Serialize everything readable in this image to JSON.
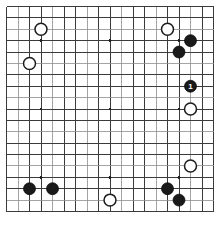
{
  "figure": {
    "type": "go-board-diagram",
    "caption": "",
    "board": {
      "size": 19,
      "visible_columns": [
        1,
        19
      ],
      "visible_rows": [
        1,
        19
      ],
      "line_color": "#3b3b3b",
      "faint_line_color": "#8d8d8d",
      "background_color": "#ffffff",
      "star_points": [
        {
          "col": 4,
          "row": 4
        },
        {
          "col": 10,
          "row": 4
        },
        {
          "col": 16,
          "row": 4
        },
        {
          "col": 4,
          "row": 10
        },
        {
          "col": 10,
          "row": 10
        },
        {
          "col": 16,
          "row": 10
        },
        {
          "col": 4,
          "row": 16
        },
        {
          "col": 10,
          "row": 16
        },
        {
          "col": 16,
          "row": 16
        }
      ]
    },
    "stones": [
      {
        "id": "w-a",
        "color": "white",
        "col": 4,
        "row": 3,
        "label": ""
      },
      {
        "id": "w-b",
        "color": "white",
        "col": 3,
        "row": 6,
        "label": ""
      },
      {
        "id": "w-c",
        "color": "white",
        "col": 15,
        "row": 3,
        "label": ""
      },
      {
        "id": "b-a",
        "color": "black",
        "col": 17,
        "row": 4,
        "label": ""
      },
      {
        "id": "b-b",
        "color": "black",
        "col": 16,
        "row": 5,
        "label": ""
      },
      {
        "id": "b-1",
        "color": "black",
        "col": 17,
        "row": 8,
        "label": "1"
      },
      {
        "id": "w-d",
        "color": "white",
        "col": 17,
        "row": 10,
        "label": ""
      },
      {
        "id": "w-e",
        "color": "white",
        "col": 17,
        "row": 15,
        "label": ""
      },
      {
        "id": "b-c",
        "color": "black",
        "col": 3,
        "row": 17,
        "label": ""
      },
      {
        "id": "b-d",
        "color": "black",
        "col": 5,
        "row": 17,
        "label": ""
      },
      {
        "id": "b-e",
        "color": "black",
        "col": 15,
        "row": 17,
        "label": ""
      },
      {
        "id": "w-f",
        "color": "white",
        "col": 10,
        "row": 18,
        "label": ""
      },
      {
        "id": "b-f",
        "color": "black",
        "col": 16,
        "row": 18,
        "label": ""
      }
    ],
    "colors": {
      "black_stone": "#1a1a1a",
      "white_stone": "#ffffff",
      "white_stone_border": "#1c1c1c",
      "move_number_text": "#ffffff"
    }
  }
}
